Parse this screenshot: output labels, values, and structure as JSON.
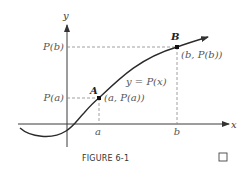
{
  "figure": {
    "caption": "FIGURE 6-1",
    "end_mark": "□"
  },
  "axes": {
    "x_label": "x",
    "y_label": "y",
    "x_ticks": [
      "a",
      "b"
    ],
    "y_ticks": [
      "P(a)",
      "P(b)"
    ]
  },
  "curve": {
    "label": "y = P(x)"
  },
  "points": {
    "A": {
      "name": "A",
      "coords": "(a, P(a))"
    },
    "B": {
      "name": "B",
      "coords": "(b, P(b))"
    }
  },
  "colors": {
    "curve": "#2a2a2a",
    "axis": "#3a3a3a",
    "dash": "#888888"
  }
}
